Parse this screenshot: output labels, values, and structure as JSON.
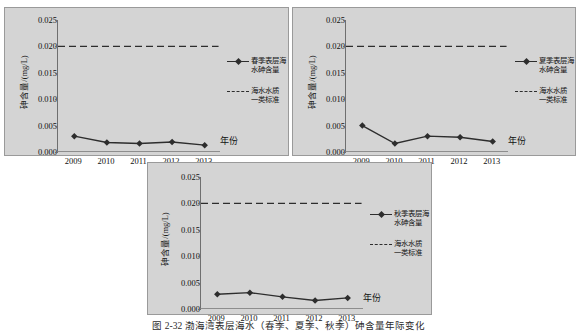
{
  "figure": {
    "caption": "图 2-32  渤海湾表层海水（春季、夏季、秋季）砷含量年际变化"
  },
  "axis": {
    "y_title": "砷含量/(mg/L)",
    "x_title": "年份",
    "y_ticks": [
      "0.025",
      "0.020",
      "0.015",
      "0.010",
      "0.005",
      "0.000"
    ],
    "x_ticks": [
      "2009",
      "2010",
      "2011",
      "2012",
      "2013"
    ]
  },
  "legend": {
    "standard_label_line1": "海水水质",
    "standard_label_line2": "一类标准"
  },
  "colors": {
    "panel_background": "#d4d4d4",
    "panel_border": "#9a9a9a",
    "series_line": "#2d2d2d",
    "standard_line": "#2d2d2d",
    "axis": "#6f6f6f",
    "page_background": "#ffffff"
  },
  "chart_data": [
    {
      "type": "line",
      "id": "spring",
      "title": "",
      "xlabel": "年份",
      "ylabel": "砷含量/(mg/L)",
      "ylim": [
        0.0,
        0.025
      ],
      "ytick_step": 0.005,
      "grid": false,
      "legend_position": "right",
      "categories": [
        "2009",
        "2010",
        "2011",
        "2012",
        "2013"
      ],
      "series": [
        {
          "name": "春季表层海水砷含量",
          "name_line1": "春季表层海",
          "name_line2": "水砷含量",
          "style": "solid-marker",
          "values": [
            0.003,
            0.0018,
            0.0016,
            0.0019,
            0.0013
          ]
        },
        {
          "name": "海水水质一类标准",
          "name_line1": "海水水质",
          "name_line2": "一类标准",
          "style": "dashed",
          "constant": 0.02
        }
      ]
    },
    {
      "type": "line",
      "id": "summer",
      "title": "",
      "xlabel": "年份",
      "ylabel": "砷含量/(mg/L)",
      "ylim": [
        0.0,
        0.025
      ],
      "ytick_step": 0.005,
      "grid": false,
      "legend_position": "right",
      "categories": [
        "2009",
        "2010",
        "2011",
        "2012",
        "2013"
      ],
      "series": [
        {
          "name": "夏季表层海水砷含量",
          "name_line1": "夏季表层海",
          "name_line2": "水砷含量",
          "style": "solid-marker",
          "values": [
            0.005,
            0.0016,
            0.003,
            0.0028,
            0.002
          ]
        },
        {
          "name": "海水水质一类标准",
          "name_line1": "海水水质",
          "name_line2": "一类标准",
          "style": "dashed",
          "constant": 0.02
        }
      ]
    },
    {
      "type": "line",
      "id": "autumn",
      "title": "",
      "xlabel": "年份",
      "ylabel": "砷含量/(mg/L)",
      "ylim": [
        0.0,
        0.025
      ],
      "ytick_step": 0.005,
      "grid": false,
      "legend_position": "right",
      "categories": [
        "2009",
        "2010",
        "2011",
        "2012",
        "2013"
      ],
      "series": [
        {
          "name": "秋季表层海水砷含量",
          "name_line1": "秋季表层海",
          "name_line2": "水砷含量",
          "style": "solid-marker",
          "values": [
            0.0028,
            0.0031,
            0.0023,
            0.0016,
            0.0021
          ]
        },
        {
          "name": "海水水质一类标准",
          "name_line1": "海水水质",
          "name_line2": "一类标准",
          "style": "dashed",
          "constant": 0.02
        }
      ]
    }
  ]
}
